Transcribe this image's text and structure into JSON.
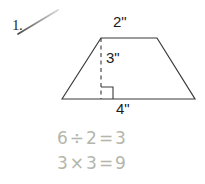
{
  "problem": {
    "number": "1.",
    "check_mark": "check-mark"
  },
  "figure": {
    "shape": "trapezoid",
    "top_label": "2\"",
    "height_label": "3\"",
    "bottom_label": "4\"",
    "right_angle_marker": "right-angle",
    "height_line_style": "dashed",
    "stroke_color": "#3a3a3a"
  },
  "student_work": {
    "line_1": "6÷2=3",
    "line_2": "3×3=9",
    "pencil_color": "#b4b6ac"
  },
  "canvas": {
    "background": "#ffffff"
  }
}
